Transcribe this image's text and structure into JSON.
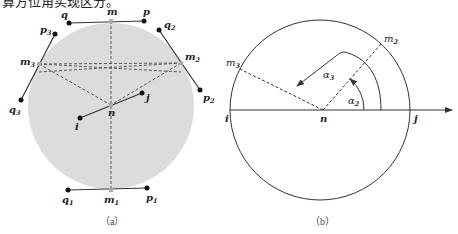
{
  "header_text": "算方位角实现区分。",
  "figure_a": {
    "caption": "（a）",
    "fill_color": "#dcdcdc",
    "labels": {
      "m": "m",
      "p": "p",
      "q": "q",
      "m1": "m",
      "m1_sub": "1",
      "p1": "p",
      "p1_sub": "1",
      "q1": "q",
      "q1_sub": "1",
      "m2": "m",
      "m2_sub": "2",
      "p2": "p",
      "p2_sub": "2",
      "q2": "q",
      "q2_sub": "2",
      "m3": "m",
      "m3_sub": "3",
      "p3": "p",
      "p3_sub": "3",
      "q3": "q",
      "q3_sub": "3",
      "n": "n",
      "i": "i",
      "j": "j"
    }
  },
  "figure_b": {
    "caption": "（b）",
    "labels": {
      "m2": "m",
      "m2_sub": "2",
      "m3": "m",
      "m3_sub": "3",
      "n": "n",
      "i": "i",
      "j": "j",
      "alpha2": "α",
      "alpha2_sub": "2",
      "alpha3": "α",
      "alpha3_sub": "3"
    }
  }
}
